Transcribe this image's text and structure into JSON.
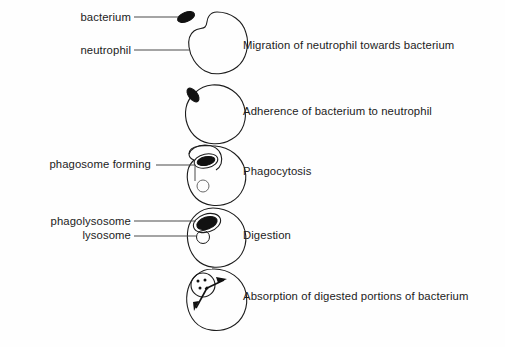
{
  "figure": {
    "background_color": "#fefefe",
    "ink_color": "#1c1c1c"
  },
  "part_labels": {
    "bacterium": "bacterium",
    "neutrophil": "neutrophil",
    "phagosome_forming": "phagosome forming",
    "phagolysosome": "phagolysosome",
    "lysosome": "lysosome"
  },
  "stages": [
    {
      "index": 1,
      "caption": "Migration of neutrophil towards bacterium"
    },
    {
      "index": 2,
      "caption": "Adherence of bacterium to neutrophil"
    },
    {
      "index": 3,
      "caption": "Phagocytosis"
    },
    {
      "index": 4,
      "caption": "Digestion"
    },
    {
      "index": 5,
      "caption": "Absorption of digested portions of bacterium"
    }
  ]
}
